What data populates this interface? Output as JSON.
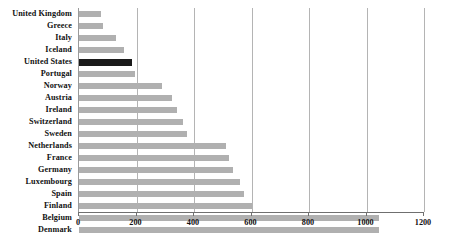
{
  "chart_data": {
    "type": "bar",
    "orientation": "horizontal",
    "title": "",
    "subtitle": "",
    "xlabel": "",
    "ylabel": "",
    "xlim": [
      0,
      1200
    ],
    "ylim": null,
    "grid": true,
    "legend": null,
    "xticks": [
      0,
      200,
      400,
      600,
      800,
      1000,
      1200
    ],
    "xtick_labels": [
      "0",
      "200",
      "400",
      "600",
      "800",
      "1000",
      "1200"
    ],
    "categories": [
      "United Kingdom",
      "Greece",
      "Italy",
      "Iceland",
      "United States",
      "Portugal",
      "Norway",
      "Austria",
      "Ireland",
      "Switzerland",
      "Sweden",
      "Netherlands",
      "France",
      "Germany",
      "Luxembourg",
      "Spain",
      "Finland",
      "Belgium",
      "Denmark"
    ],
    "values": [
      75,
      85,
      130,
      155,
      185,
      195,
      290,
      325,
      340,
      360,
      375,
      510,
      520,
      535,
      560,
      575,
      600,
      1045,
      1045
    ],
    "highlight_category": "United States",
    "colors": {
      "bar": "#b0b0b0",
      "highlight_bar": "#1a1a1a",
      "gridline": "#b4b4b4",
      "axis": "#6f6f6f",
      "text": "#111111",
      "background": "#ffffff"
    }
  }
}
